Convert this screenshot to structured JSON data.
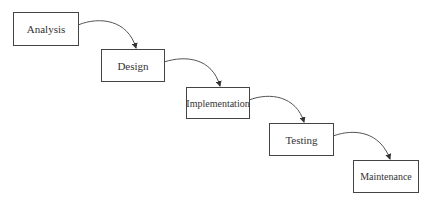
{
  "diagram": {
    "type": "waterfall-process",
    "stages": [
      {
        "label": "Analysis"
      },
      {
        "label": "Design"
      },
      {
        "label": "Implementation"
      },
      {
        "label": "Testing"
      },
      {
        "label": "Maintenance"
      }
    ],
    "edges": [
      {
        "from": "Analysis",
        "to": "Design"
      },
      {
        "from": "Design",
        "to": "Implementation"
      },
      {
        "from": "Implementation",
        "to": "Testing"
      },
      {
        "from": "Testing",
        "to": "Maintenance"
      }
    ],
    "colors": {
      "box_border": "#444444",
      "arrow": "#444444",
      "text": "#333333",
      "background": "#ffffff"
    }
  }
}
